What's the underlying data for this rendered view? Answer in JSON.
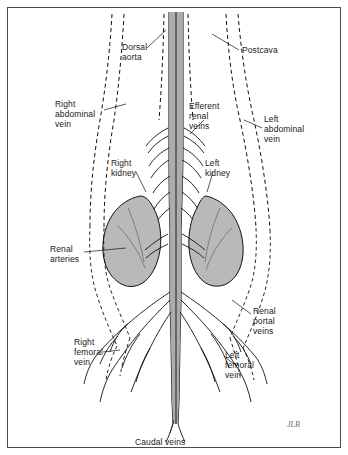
{
  "figure": {
    "border_color": "#4a4a4a",
    "kidney_fill": "#b9b9b9",
    "vessel_stroke": "#111111",
    "dashed_stroke": "#111111",
    "signature": "JLB"
  },
  "labels": [
    {
      "id": "dorsal-aorta",
      "text": "Dorsal\naorta",
      "x": 122,
      "y": 42,
      "align": "left"
    },
    {
      "id": "postcava",
      "text": "Postcava",
      "x": 242,
      "y": 45,
      "align": "left"
    },
    {
      "id": "right-abdominal-vein",
      "text": "Right\nabdominal\nvein",
      "x": 55,
      "y": 99,
      "align": "left"
    },
    {
      "id": "efferent-renal-veins",
      "text": "Efferent\nrenal\nveins",
      "x": 189,
      "y": 101,
      "align": "left"
    },
    {
      "id": "left-abdominal-vein",
      "text": "Left\nabdominal\nvein",
      "x": 264,
      "y": 114,
      "align": "left"
    },
    {
      "id": "right-kidney",
      "text": "Right\nkidney",
      "x": 111,
      "y": 158,
      "align": "left"
    },
    {
      "id": "left-kidney",
      "text": "Left\nkidney",
      "x": 205,
      "y": 158,
      "align": "left"
    },
    {
      "id": "renal-arteries",
      "text": "Renal\narteries",
      "x": 50,
      "y": 244,
      "align": "left"
    },
    {
      "id": "renal-portal-veins",
      "text": "Renal\nportal\nveins",
      "x": 253,
      "y": 306,
      "align": "left"
    },
    {
      "id": "right-femoral-vein",
      "text": "Right\nfemoral\nvein",
      "x": 74,
      "y": 337,
      "align": "left"
    },
    {
      "id": "left-femoral-vein",
      "text": "Left\nfemoral\nvein",
      "x": 225,
      "y": 350,
      "align": "left"
    },
    {
      "id": "caudal-veins",
      "text": "Caudal veins",
      "x": 135,
      "y": 437,
      "align": "left"
    }
  ]
}
